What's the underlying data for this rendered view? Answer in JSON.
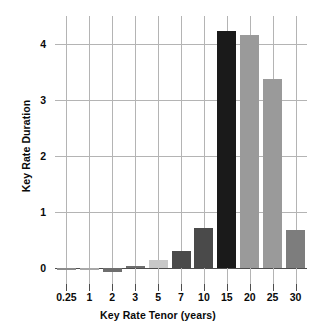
{
  "chart_data": {
    "type": "bar",
    "title": "",
    "xlabel": "Key Rate Tenor (years)",
    "ylabel": "Key Rate Duration",
    "categories": [
      "0.25",
      "1",
      "2",
      "3",
      "5",
      "7",
      "10",
      "15",
      "20",
      "25",
      "30"
    ],
    "values": [
      0.0,
      -0.03,
      -0.08,
      0.04,
      0.15,
      0.3,
      0.71,
      4.23,
      4.16,
      3.38,
      0.68
    ],
    "bar_colors": [
      "#8c8c8c",
      "#a8a8a8",
      "#6e6e6e",
      "#6e6e6e",
      "#c8c8c8",
      "#4a4a4a",
      "#4a4a4a",
      "#1a1a1a",
      "#9a9a9a",
      "#9a9a9a",
      "#7d7d7d"
    ],
    "ylim": [
      -0.15,
      4.64
    ],
    "yticks": [
      0,
      1,
      2,
      3,
      4
    ],
    "ytick_labels": [
      "0",
      "1",
      "2",
      "3",
      "4"
    ],
    "grid": true,
    "legend": "none",
    "axis_color": "#4d4d4d",
    "grid_color": "#b4b4b4",
    "background": "#ffffff"
  }
}
